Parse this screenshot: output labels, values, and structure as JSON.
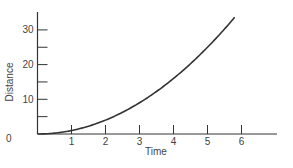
{
  "chart_data": {
    "type": "line",
    "title": "",
    "xlabel": "Time",
    "ylabel": "Distance",
    "x_ticks": [
      "0",
      "1",
      "2",
      "3",
      "4",
      "5",
      "6"
    ],
    "y_ticks": [
      "0",
      "10",
      "20",
      "30"
    ],
    "xlim": [
      0,
      7
    ],
    "ylim": [
      0,
      35
    ],
    "grid": false,
    "legend": null,
    "series": [
      {
        "name": "distance",
        "x": [
          0,
          0.5,
          1,
          1.5,
          2,
          2.5,
          3,
          3.5,
          4,
          4.5,
          5,
          5.5,
          5.8
        ],
        "values": [
          0,
          0.25,
          1,
          2.25,
          4,
          6.25,
          9,
          12.25,
          16,
          20.25,
          25,
          30.25,
          33.6
        ]
      }
    ]
  }
}
